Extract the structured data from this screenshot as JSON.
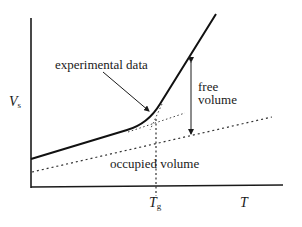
{
  "diagram": {
    "axes": {
      "y_label_main": "V",
      "y_label_sub": "s",
      "x_label": "T",
      "x_tick_main": "T",
      "x_tick_sub": "g"
    },
    "annotations": {
      "experimental": "experimental  data",
      "free_line1": "free",
      "free_line2": "volume",
      "occupied": "occupied volume"
    },
    "colors": {
      "ink": "#1a1a1a",
      "dotted": "#333333"
    }
  }
}
